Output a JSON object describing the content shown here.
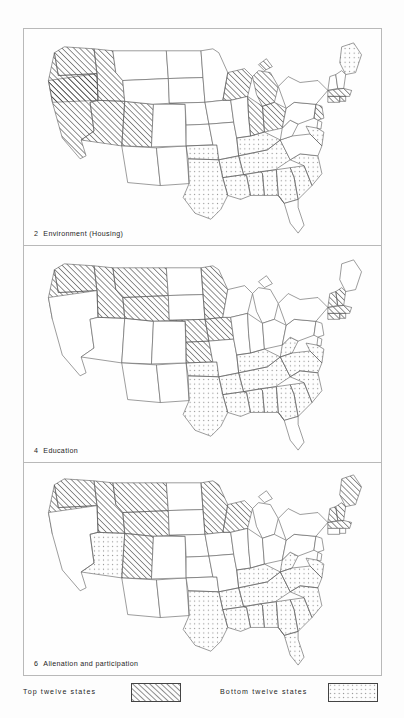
{
  "figure": {
    "type": "choropleth-map-series",
    "region": "United States (contiguous 48 states)",
    "panels": [
      {
        "number": "2",
        "title": "Environment (Housing)",
        "caption": "2  Environment (Housing)",
        "top_twelve_states": [
          "Washington",
          "Oregon",
          "California",
          "Nevada",
          "Idaho",
          "Utah",
          "Wisconsin",
          "Michigan",
          "Indiana",
          "Ohio",
          "Connecticut",
          "Rhode Island"
        ],
        "bottom_twelve_states": [
          "Oklahoma",
          "Texas",
          "Arkansas",
          "Louisiana",
          "Mississippi",
          "Alabama",
          "Tennessee",
          "Georgia",
          "South Carolina",
          "North Carolina",
          "Kentucky",
          "Maine"
        ]
      },
      {
        "number": "4",
        "title": "Education",
        "caption": "4  Education",
        "top_twelve_states": [
          "Washington",
          "Oregon",
          "Idaho",
          "Montana",
          "Wyoming",
          "Nebraska",
          "Kansas",
          "Iowa",
          "Minnesota",
          "Massachusetts",
          "Connecticut",
          "Rhode Island"
        ],
        "bottom_twelve_states": [
          "Texas",
          "Oklahoma",
          "Arkansas",
          "Louisiana",
          "Mississippi",
          "Alabama",
          "Tennessee",
          "Kentucky",
          "Georgia",
          "South Carolina",
          "North Carolina",
          "Virginia"
        ]
      },
      {
        "number": "6",
        "title": "Alienation and participation",
        "caption": "6  Alienation and participation",
        "top_twelve_states": [
          "Washington",
          "Oregon",
          "Idaho",
          "Utah",
          "Montana",
          "Wyoming",
          "Minnesota",
          "Wisconsin",
          "Vermont",
          "New Hampshire",
          "Massachusetts",
          "Maine"
        ],
        "bottom_twelve_states": [
          "Nevada",
          "Texas",
          "Louisiana",
          "Mississippi",
          "Alabama",
          "Georgia",
          "South Carolina",
          "North Carolina",
          "Virginia",
          "Tennessee",
          "Arkansas",
          "Florida"
        ]
      }
    ]
  },
  "legend": {
    "entries": [
      {
        "label": "Top  twelve  states",
        "pattern": "diagonal-hatch"
      },
      {
        "label": "Bottom  twelve  states",
        "pattern": "dot-stipple"
      }
    ]
  },
  "colors": {
    "page_background": "#fdfdfd",
    "panel_background": "#fefefe",
    "panel_border": "#b9b9b9",
    "map_outline": "#2a2a2a",
    "state_border": "#6a6a6a",
    "hatch_line": "#2e2e2e",
    "dot": "#8c8c8c",
    "text": "#1d1d1d"
  }
}
